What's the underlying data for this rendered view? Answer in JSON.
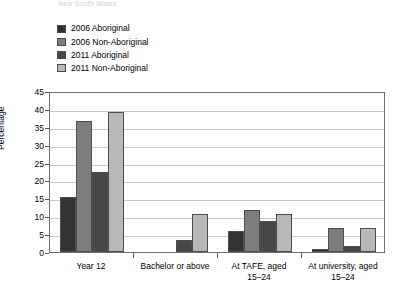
{
  "title_ghost": "New South Wales",
  "legend": {
    "items": [
      {
        "label": "2006 Aboriginal",
        "color": "#333333"
      },
      {
        "label": "2006 Non-Aboriginal",
        "color": "#7d7d7d"
      },
      {
        "label": "2011 Aboriginal",
        "color": "#474747"
      },
      {
        "label": "2011 Non-Aboriginal",
        "color": "#b8b8b8"
      }
    ]
  },
  "chart_data": {
    "type": "bar",
    "title": "",
    "xlabel": "",
    "ylabel": "Percentage",
    "ylim": [
      0,
      45
    ],
    "yticks": [
      0,
      5,
      10,
      15,
      20,
      25,
      30,
      35,
      40,
      45
    ],
    "grid": true,
    "legend_position": "above-plot-left",
    "categories": [
      "Year 12",
      "Bachelor or above",
      "At TAFE, aged\n15–24",
      "At university, aged\n15–24"
    ],
    "category_lines": [
      [
        "Year 12"
      ],
      [
        "Bachelor or above"
      ],
      [
        "At TAFE, aged",
        "15–24"
      ],
      [
        "At university, aged",
        "15–24"
      ]
    ],
    "series": [
      {
        "name": "2006 Aboriginal",
        "color": "#333333",
        "values": [
          15.5,
          0,
          5.8,
          0.8
        ]
      },
      {
        "name": "2006 Non-Aboriginal",
        "color": "#7d7d7d",
        "values": [
          36.5,
          0,
          11.8,
          6.8
        ]
      },
      {
        "name": "2011 Aboriginal",
        "color": "#474747",
        "values": [
          22.5,
          3.4,
          8.8,
          1.6
        ]
      },
      {
        "name": "2011 Non-Aboriginal",
        "color": "#b8b8b8",
        "values": [
          39.0,
          10.6,
          10.5,
          6.8
        ]
      }
    ]
  }
}
